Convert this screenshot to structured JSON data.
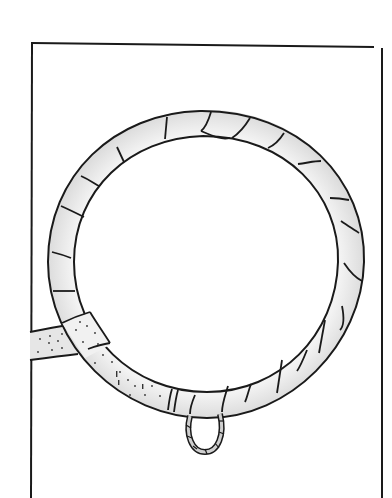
{
  "figure": {
    "style": "black ink line drawing with light gray shading",
    "colors": {
      "background": "#ffffff",
      "ink": "#1a1a1a",
      "shade": "#d9d9d9",
      "shade_light": "#ececec"
    },
    "parts": {
      "frame": "rectangular border",
      "ring": "circular hoop wrapped in segmented tape",
      "rope": "dotted rope entering from left",
      "loop": "small striped loop hanging below ring"
    }
  }
}
